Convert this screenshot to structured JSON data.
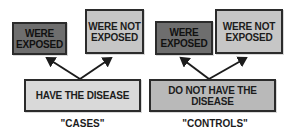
{
  "diagram": {
    "groups": [
      {
        "id": "cases",
        "label": "\"CASES\"",
        "condition": "HAVE THE DISEASE",
        "outcomes": [
          {
            "label": "WERE EXPOSED"
          },
          {
            "label": "WERE NOT EXPOSED"
          }
        ]
      },
      {
        "id": "controls",
        "label": "\"CONTROLS\"",
        "condition": "DO NOT HAVE THE DISEASE",
        "outcomes": [
          {
            "label": "WERE EXPOSED"
          },
          {
            "label": "WERE NOT EXPOSED"
          }
        ]
      }
    ],
    "colors": {
      "exposed": "#6e6e6e",
      "not_exposed": "#c6c6c6",
      "has_disease": "#d9d9d9",
      "no_disease": "#b9b9b9",
      "stroke": "#2b2b2b"
    }
  }
}
